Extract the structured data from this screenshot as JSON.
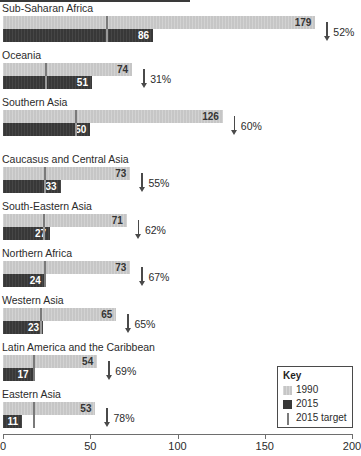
{
  "chart_data": {
    "type": "bar",
    "title": "",
    "xlabel": "",
    "ylabel": "",
    "orientation": "horizontal",
    "xlim": [
      0,
      200
    ],
    "xticks": [
      0,
      50,
      100,
      150,
      200
    ],
    "xtick_labels": [
      "0",
      "50",
      "100",
      "150",
      "200"
    ],
    "grid": false,
    "legend_position": "bottom-right",
    "categories": [
      "Sub-Saharan Africa",
      "Oceania",
      "Southern Asia",
      "Caucasus and Central Asia",
      "South-Eastern Asia",
      "Northern Africa",
      "Western Asia",
      "Latin America and the Caribbean",
      "Eastern Asia"
    ],
    "series": [
      {
        "name": "1990",
        "color": "#c6c6c6",
        "values": [
          179,
          74,
          126,
          73,
          71,
          73,
          65,
          54,
          53
        ]
      },
      {
        "name": "2015",
        "color": "#383838",
        "values": [
          86,
          51,
          50,
          33,
          27,
          24,
          23,
          17,
          11
        ]
      },
      {
        "name": "2015 target",
        "color": "#7a7a7a",
        "values": [
          59.7,
          24.7,
          42.0,
          24.3,
          23.7,
          24.3,
          21.7,
          18.0,
          17.7
        ]
      }
    ],
    "annotations": [
      {
        "category": "Sub-Saharan Africa",
        "label": "52%",
        "icon": "arrow-down"
      },
      {
        "category": "Oceania",
        "label": "31%",
        "icon": "arrow-down"
      },
      {
        "category": "Southern Asia",
        "label": "60%",
        "icon": "arrow-down"
      },
      {
        "category": "Caucasus and Central Asia",
        "label": "55%",
        "icon": "arrow-down"
      },
      {
        "category": "South-Eastern Asia",
        "label": "62%",
        "icon": "arrow-down"
      },
      {
        "category": "Northern Africa",
        "label": "67%",
        "icon": "arrow-down"
      },
      {
        "category": "Western Asia",
        "label": "65%",
        "icon": "arrow-down"
      },
      {
        "category": "Latin America and the Caribbean",
        "label": "69%",
        "icon": "arrow-down"
      },
      {
        "category": "Eastern Asia",
        "label": "78%",
        "icon": "arrow-down"
      }
    ]
  },
  "legend": {
    "title": "Key",
    "items": [
      {
        "label": "1990",
        "swatch": "light-gray-square",
        "color": "#c6c6c6"
      },
      {
        "label": "2015",
        "swatch": "dark-gray-square",
        "color": "#383838"
      },
      {
        "label": "2015 target",
        "swatch": "vertical-line",
        "color": "#7a7a7a"
      }
    ]
  },
  "axis": {
    "ticks": [
      {
        "value": 0,
        "label": "0"
      },
      {
        "value": 50,
        "label": "50"
      },
      {
        "value": 100,
        "label": "100"
      },
      {
        "value": 150,
        "label": "150"
      },
      {
        "value": 200,
        "label": "200"
      }
    ]
  },
  "rows": [
    {
      "label": "Sub-Saharan Africa",
      "v1990": 179,
      "v2015": 86,
      "target": 59.7,
      "pct": "52%"
    },
    {
      "label": "Oceania",
      "v1990": 74,
      "v2015": 51,
      "target": 24.7,
      "pct": "31%"
    },
    {
      "label": "Southern Asia",
      "v1990": 126,
      "v2015": 50,
      "target": 42.0,
      "pct": "60%"
    },
    {
      "label": "Caucasus and Central Asia",
      "v1990": 73,
      "v2015": 33,
      "target": 24.3,
      "pct": "55%"
    },
    {
      "label": "South-Eastern Asia",
      "v1990": 71,
      "v2015": 27,
      "target": 23.7,
      "pct": "62%"
    },
    {
      "label": "Northern Africa",
      "v1990": 73,
      "v2015": 24,
      "target": 24.3,
      "pct": "67%"
    },
    {
      "label": "Western Asia",
      "v1990": 65,
      "v2015": 23,
      "target": 21.7,
      "pct": "65%"
    },
    {
      "label": "Latin America and the Caribbean",
      "v1990": 54,
      "v2015": 17,
      "target": 18.0,
      "pct": "69%"
    },
    {
      "label": "Eastern Asia",
      "v1990": 53,
      "v2015": 11,
      "target": 17.7,
      "pct": "78%"
    }
  ]
}
